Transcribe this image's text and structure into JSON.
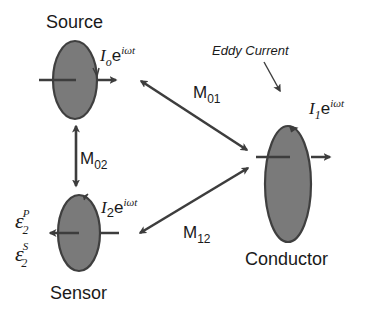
{
  "diagram": {
    "colors": {
      "coil_fill": "#7a7a7a",
      "coil_stroke": "#3f3f3f",
      "arrow": "#3d3d3d",
      "text": "#1a1a1a",
      "background": "#ffffff"
    },
    "nodes": {
      "source": {
        "label": "Source",
        "current_base": "I",
        "current_sub": "o",
        "current_exp_base": "e",
        "current_exp": "iωt"
      },
      "sensor": {
        "label": "Sensor",
        "current_base": "I",
        "current_sub": "2",
        "current_exp_base": "e",
        "current_exp": "iωt",
        "emf_primary_base": "ε",
        "emf_primary_sup": "P",
        "emf_primary_sub": "2",
        "emf_secondary_base": "ε",
        "emf_secondary_sup": "S",
        "emf_secondary_sub": "2"
      },
      "conductor": {
        "label": "Conductor",
        "current_base": "I",
        "current_sub": "1",
        "current_exp_base": "e",
        "current_exp": "iωt"
      }
    },
    "annotations": {
      "eddy_current": "Eddy Current"
    },
    "couplings": {
      "m01": {
        "base": "M",
        "sub": "01"
      },
      "m02": {
        "base": "M",
        "sub": "02"
      },
      "m12": {
        "base": "M",
        "sub": "12"
      }
    }
  }
}
